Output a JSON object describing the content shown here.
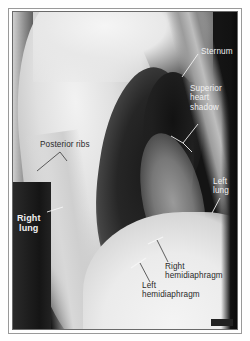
{
  "figure": {
    "type": "lateral chest radiograph",
    "labels": {
      "sternum": "Sternum",
      "superior_heart_shadow_l1": "Superior",
      "superior_heart_shadow_l2": "heart",
      "superior_heart_shadow_l3": "shadow",
      "posterior_ribs": "Posterior ribs",
      "left_lung_l1": "Left",
      "left_lung_l2": "lung",
      "right_lung_l1": "Right",
      "right_lung_l2": "lung",
      "right_hemidiaphragm_l1": "Right",
      "right_hemidiaphragm_l2": "hemidiaphragm",
      "left_hemidiaphragm_l1": "Left",
      "left_hemidiaphragm_l2": "hemidiaphragm"
    },
    "colors": {
      "label_light": "#f0f0f0",
      "label_dark": "#2a2a2a",
      "frame": "#9a9a9a",
      "background": "#ffffff"
    }
  }
}
